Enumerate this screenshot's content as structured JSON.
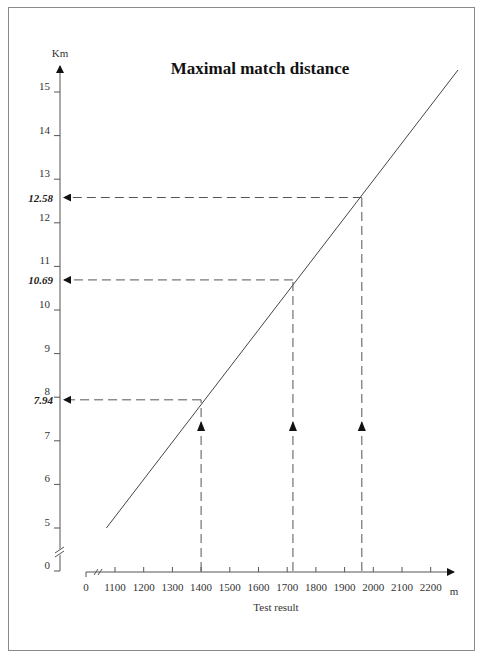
{
  "chart_data": {
    "type": "line",
    "title": "Maximal match distance",
    "xlabel": "Test result",
    "x_unit": "m",
    "ylabel": "Km",
    "x_ticks": [
      "0",
      "1100",
      "1200",
      "1300",
      "1400",
      "1500",
      "1600",
      "1700",
      "1800",
      "1900",
      "2000",
      "2100",
      "2200"
    ],
    "y_ticks": [
      "0",
      "5",
      "6",
      "7",
      "8",
      "9",
      "10",
      "11",
      "12",
      "13",
      "14",
      "15"
    ],
    "xlim": [
      1000,
      2250
    ],
    "ylim": [
      0,
      15.5
    ],
    "axis_breaks": {
      "x": true,
      "y": true
    },
    "grid": false,
    "series": [
      {
        "name": "Maximal match distance",
        "x": [
          1070,
          1400,
          1720,
          1960,
          2290
        ],
        "y": [
          5.0,
          7.94,
          10.69,
          12.58,
          15.4
        ]
      }
    ],
    "annotations": [
      {
        "x": 1400,
        "y": 7.94,
        "label": "7.94"
      },
      {
        "x": 1720,
        "y": 10.69,
        "label": "10.69"
      },
      {
        "x": 1960,
        "y": 12.58,
        "label": "12.58"
      }
    ]
  }
}
